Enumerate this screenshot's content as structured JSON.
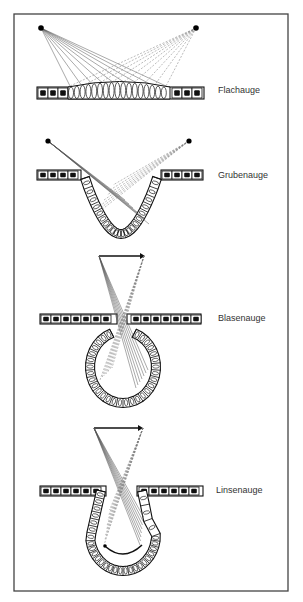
{
  "figure": {
    "panels": [
      {
        "id": "flachauge",
        "label": "Flachauge"
      },
      {
        "id": "grubenauge",
        "label": "Grubenauge"
      },
      {
        "id": "blasenauge",
        "label": "Blasenauge"
      },
      {
        "id": "linsenauge",
        "label": "Linsenauge"
      }
    ]
  },
  "colors": {
    "background": "#ffffff",
    "frame": "#444444",
    "ink": "#111111",
    "rays": "#555555"
  }
}
